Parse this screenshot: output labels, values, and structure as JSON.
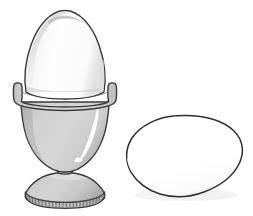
{
  "illustration": {
    "title": "Egg in egg cup with a loose egg",
    "background_color": "#ffffff",
    "width": 253,
    "height": 216,
    "style": "line art with grey tonal shading",
    "outline_color": "#3a3a3a",
    "objects": [
      {
        "name": "egg-cup-with-egg",
        "label": "Egg standing in an egg cup",
        "position": "left",
        "parts": [
          {
            "name": "egg-in-cup",
            "label": "Egg",
            "fill_color": "#fdfdfd",
            "shade_color": "#c9c9c9",
            "outline_color": "#3a3a3a"
          },
          {
            "name": "cup-rim",
            "label": "Cup rim band",
            "fill_color": "#d4d4d4",
            "outline_color": "#3a3a3a"
          },
          {
            "name": "cup-bowl",
            "label": "Cup bowl",
            "fill_color": "#cfcfcf",
            "highlight_color": "#fbfbfb",
            "outline_color": "#3a3a3a"
          },
          {
            "name": "cup-stem",
            "label": "Cup stem",
            "fill_color": "#c4c4c4",
            "outline_color": "#3a3a3a"
          },
          {
            "name": "cup-foot",
            "label": "Cup foot",
            "fill_color": "#cdcdcd",
            "outline_color": "#3a3a3a"
          },
          {
            "name": "cup-foot-fluting",
            "label": "Ribbed fluting on foot edge",
            "fill_color": "#b4b4b4",
            "rib_count": 30,
            "outline_color": "#3a3a3a"
          }
        ]
      },
      {
        "name": "loose-egg",
        "label": "Loose egg lying on its side",
        "position": "right",
        "parts": [
          {
            "name": "loose-egg-body",
            "label": "Egg body",
            "fill_color": "#ffffff",
            "outline_color": "#2f2f2f"
          },
          {
            "name": "loose-egg-shadow",
            "label": "Soft shadow under egg",
            "fill_color": "#ededed"
          }
        ]
      }
    ]
  }
}
